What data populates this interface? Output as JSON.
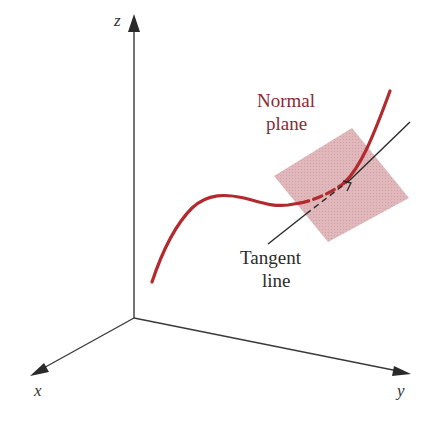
{
  "figure": {
    "type": "3d-curve-normal-plane",
    "axes": {
      "x_label": "x",
      "y_label": "y",
      "z_label": "z"
    },
    "labels": {
      "normal_plane_line1": "Normal",
      "normal_plane_line2": "plane",
      "tangent_line1": "Tangent",
      "tangent_line2": "line"
    },
    "colors": {
      "curve": "#b32a2e",
      "plane_fill": "#dcb0b3",
      "axis": "#3a3a3a",
      "tangent": "#2a2a2a",
      "normal_label": "#8a2a35",
      "tangent_label": "#2b2b2b",
      "background": "#ffffff"
    }
  }
}
